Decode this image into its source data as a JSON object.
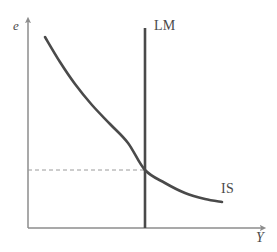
{
  "figure": {
    "type": "economics-diagram",
    "name": "IS-LM exchange rate diagram",
    "background_color": "#ffffff"
  },
  "axes": {
    "y_axis": {
      "label": "e",
      "name": "exchange-rate-axis",
      "color": "#8c8c8c",
      "origin": [
        28,
        228
      ],
      "tip": [
        28,
        18
      ],
      "arrow": true
    },
    "x_axis": {
      "label": "Y",
      "name": "output-axis",
      "color": "#8c8c8c",
      "origin": [
        28,
        228
      ],
      "tip": [
        266,
        228
      ],
      "arrow": true
    }
  },
  "chart_data": {
    "type": "line",
    "title": "",
    "xlabel": "Y",
    "ylabel": "e",
    "grid": false,
    "legend": "inline-curve-labels",
    "xlim": [
      28,
      266
    ],
    "ylim": [
      228,
      18
    ],
    "series": [
      {
        "name": "IS",
        "label": "IS",
        "shape": "downward-sloping convex curve",
        "color": "#4a4a4a",
        "width": 2.6,
        "points": [
          [
            45,
            37
          ],
          [
            60,
            62
          ],
          [
            75,
            84
          ],
          [
            92,
            105
          ],
          [
            110,
            124
          ],
          [
            128,
            143
          ],
          [
            145,
            170
          ],
          [
            165,
            183
          ],
          [
            185,
            193
          ],
          [
            205,
            199
          ],
          [
            222,
            202
          ]
        ]
      },
      {
        "name": "LM",
        "label": "LM",
        "shape": "vertical line",
        "color": "#4a4a4a",
        "width": 2.6,
        "points": [
          [
            145,
            28
          ],
          [
            145,
            228
          ]
        ]
      }
    ],
    "annotations": [
      {
        "name": "equilibrium-dashed-line",
        "style": "dashed",
        "color": "#9a9a9a",
        "from": [
          28,
          170
        ],
        "to": [
          145,
          170
        ],
        "dash": "4 3"
      }
    ],
    "equilibrium": {
      "point": [
        145,
        170
      ],
      "description": "intersection of IS and LM"
    }
  },
  "labels": {
    "y_axis_label": "e",
    "x_axis_label": "Y",
    "lm_label": "LM",
    "is_label": "IS"
  }
}
